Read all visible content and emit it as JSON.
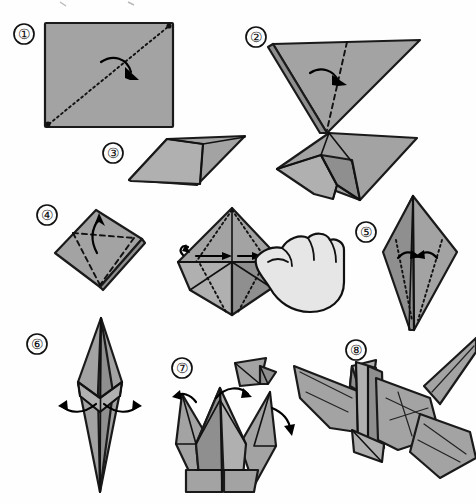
{
  "document": {
    "title": "Origami Crane Folding Instructions",
    "type": "step-by-step illustrated diagram",
    "paper_color": "#a3a3a3",
    "line_color": "#1a1a1a",
    "background_color": "#ffffff",
    "step_count": 8
  },
  "steps": [
    {
      "number": "1",
      "label": "①",
      "marker_x": 24,
      "marker_y": 34,
      "caption": "Square sheet with diagonal valley fold",
      "figure": "square-with-diagonal-fold",
      "fold_type": "valley",
      "arrow": "curved-fold-over"
    },
    {
      "number": "2",
      "label": "②",
      "marker_x": 256,
      "marker_y": 37,
      "caption": "Folded triangle, fold in half along vertical crease",
      "figure": "downward-triangle",
      "fold_type": "valley",
      "arrow": "curved-fold-right"
    },
    {
      "number": "3",
      "label": "③",
      "marker_x": 113,
      "marker_y": 153,
      "caption": "Square flap folded over triangle",
      "figure": "square-over-triangle",
      "fold_type": "none",
      "arrow": "none"
    },
    {
      "number": "4",
      "label": "④",
      "marker_x": 47,
      "marker_y": 215,
      "caption": "Diamond preliminary base, petal fold upward",
      "figure": "diamond-with-dashed-triangle",
      "fold_type": "valley",
      "arrow": "up"
    },
    {
      "number": "5",
      "label": "⑤",
      "marker_x": 366,
      "marker_y": 232,
      "caption": "Bird base, fold side edges to center",
      "figure": "elongated-diamond",
      "fold_type": "valley",
      "arrow": "inward-both-sides"
    },
    {
      "number": "6",
      "label": "⑥",
      "marker_x": 37,
      "marker_y": 344,
      "caption": "Narrow kite shape, pull points outward",
      "figure": "narrow-diamond",
      "fold_type": "reverse",
      "arrow": "outward-both-sides"
    },
    {
      "number": "7",
      "label": "⑦",
      "marker_x": 182,
      "marker_y": 368,
      "caption": "Form head and tail with reverse folds",
      "figure": "crane-body-with-spikes",
      "fold_type": "inside-reverse",
      "arrow": "curved-down-both"
    },
    {
      "number": "8",
      "label": "⑧",
      "marker_x": 356,
      "marker_y": 350,
      "caption": "Finished paper crane with spread wings",
      "figure": "finished-crane",
      "fold_type": "none",
      "arrow": "none"
    }
  ],
  "intermediate_figures": [
    {
      "name": "step-3-result",
      "caption": "Intermediate folded form after step 3",
      "position": "right of step 3"
    },
    {
      "name": "step-4-hand-action",
      "caption": "Hand opening and flattening the flap",
      "position": "center, right of step 4",
      "has_hand_illustration": true
    },
    {
      "name": "step-7-head-inset",
      "caption": "Detail inset of head reverse fold",
      "position": "above step 7"
    }
  ]
}
